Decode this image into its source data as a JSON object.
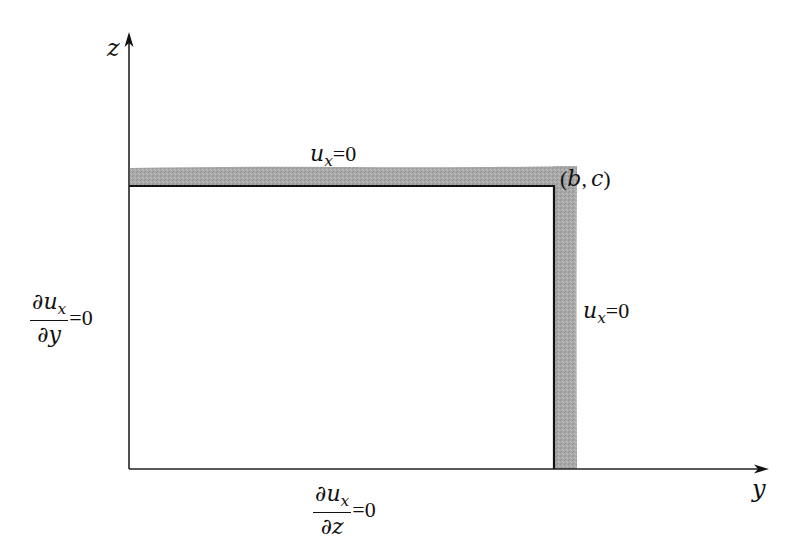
{
  "diagram": {
    "type": "boundary-conditions-rectangle",
    "colors": {
      "line": "#111111",
      "shaded_boundary": "#a9a9a9",
      "background": "#ffffff"
    },
    "axes": {
      "vertical": {
        "label": "z"
      },
      "horizontal": {
        "label": "y"
      }
    },
    "corner_point": {
      "label": "(b, c)",
      "open_paren": "(",
      "b": "b",
      "comma": ",",
      "c": "c",
      "close_paren": ")"
    },
    "boundaries": {
      "top": {
        "variable": "u",
        "subscript": "x",
        "equals": "=",
        "value": "0",
        "condition": "u_x=0"
      },
      "right": {
        "variable": "u",
        "subscript": "x",
        "equals": "=",
        "value": "0",
        "condition": "u_x=0"
      },
      "left": {
        "numerator_partial": "∂",
        "numerator_var": "u",
        "numerator_sub": "x",
        "denominator_partial": "∂",
        "denominator_var": "y",
        "equals": "=",
        "value": "0",
        "condition": "∂u_x/∂y=0"
      },
      "bottom": {
        "numerator_partial": "∂",
        "numerator_var": "u",
        "numerator_sub": "x",
        "denominator_partial": "∂",
        "denominator_var": "z",
        "equals": "=",
        "value": "0",
        "condition": "∂u_x/∂z=0"
      }
    }
  }
}
